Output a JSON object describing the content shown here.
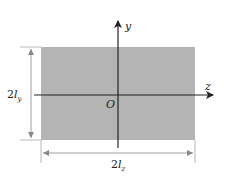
{
  "diagram": {
    "type": "cross-section",
    "shape": "rectangle",
    "fill_color": "#b4b4b4",
    "line_color": "#222222",
    "dimension_color": "#888888",
    "axes": {
      "y_label": "y",
      "z_label": "z",
      "origin_label": "O"
    },
    "dimensions": {
      "height": {
        "prefix": "2",
        "symbol": "l",
        "subscript": "y"
      },
      "width": {
        "prefix": "2",
        "symbol": "l",
        "subscript": "z"
      }
    }
  }
}
